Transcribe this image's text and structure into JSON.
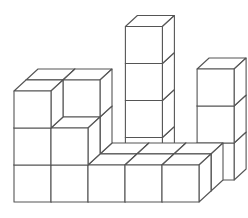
{
  "figure": {
    "colors": {
      "face": "#ffffff",
      "edge": "#555555",
      "background": "#ffffff"
    },
    "cube_size_px": 37,
    "depth_offset_px": [
      12,
      -11
    ],
    "front_row_columns": 5,
    "columns": [
      {
        "label": "col1",
        "front_height": 3
      },
      {
        "label": "col2",
        "front_height": 2,
        "back_height": 3
      },
      {
        "label": "col3",
        "front_height": 1
      },
      {
        "label": "col4",
        "front_height": 1,
        "tower_height": 5
      },
      {
        "label": "col5",
        "front_height": 1
      },
      {
        "label": "right-tower",
        "height": 4
      }
    ]
  }
}
